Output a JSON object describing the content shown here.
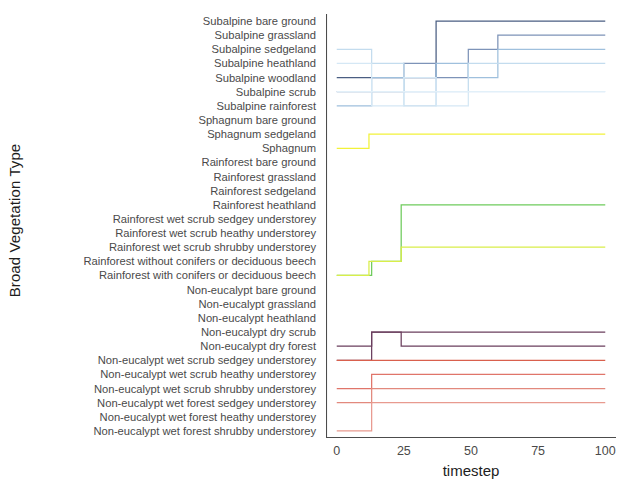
{
  "chart_data": {
    "type": "line",
    "title": "",
    "xlabel": "timestep",
    "ylabel": "Broad Vegetation Type",
    "xlim": [
      -4,
      104
    ],
    "ylim": [
      0,
      30
    ],
    "grid": false,
    "legend": "none",
    "xticks": [
      0,
      25,
      50,
      75,
      100
    ],
    "xticklabels": [
      "0",
      "25",
      "50",
      "75",
      "100"
    ],
    "categories": [
      "Subalpine bare ground",
      "Subalpine grassland",
      "Subalpine sedgeland",
      "Subalpine heathland",
      "Subalpine woodland",
      "Subalpine scrub",
      "Subalpine rainforest",
      "Sphagnum bare ground",
      "Sphagnum sedgeland",
      "Sphagnum",
      "Rainforest bare ground",
      "Rainforest grassland",
      "Rainforest sedgeland",
      "Rainforest heathland",
      "Rainforest wet scrub sedgey understorey",
      "Rainforest wet scrub heathy understorey",
      "Rainforest wet scrub shrubby understorey",
      "Rainforest without conifers or deciduous beech",
      "Rainforest with conifers or deciduous beech",
      "Non-eucalypt bare ground",
      "Non-eucalypt grassland",
      "Non-eucalypt heathland",
      "Non-eucalypt dry scrub",
      "Non-eucalypt dry forest",
      "Non-eucalypt wet scrub sedgey understorey",
      "Non-eucalypt wet scrub heathy understorey",
      "Non-eucalypt wet scrub shrubby understorey",
      "Non-eucalypt wet forest sedgey understorey",
      "Non-eucalypt wet forest heathy understorey",
      "Non-eucalypt wet forest shrubby understorey"
    ],
    "series": [
      {
        "name": "Subalpine bare ground",
        "color": "#4a5e82",
        "points": [
          [
            0,
            4
          ],
          [
            37,
            4
          ],
          [
            37,
            0
          ],
          [
            100,
            0
          ]
        ]
      },
      {
        "name": "Subalpine grassland",
        "color": "#7d93b8",
        "points": [
          [
            0,
            5
          ],
          [
            25,
            5
          ],
          [
            25,
            3
          ],
          [
            37,
            3
          ],
          [
            37,
            4
          ],
          [
            49,
            4
          ],
          [
            49,
            2
          ],
          [
            60,
            2
          ],
          [
            60,
            1
          ],
          [
            100,
            1
          ]
        ]
      },
      {
        "name": "Subalpine sedgeland",
        "color": "#9fc0dd",
        "points": [
          [
            0,
            6
          ],
          [
            13,
            6
          ],
          [
            13,
            4
          ],
          [
            25,
            4
          ],
          [
            25,
            5
          ],
          [
            37,
            5
          ],
          [
            37,
            3
          ],
          [
            49,
            3
          ],
          [
            49,
            4
          ],
          [
            60,
            4
          ],
          [
            60,
            2
          ],
          [
            100,
            2
          ]
        ]
      },
      {
        "name": "Subalpine heathland",
        "color": "#c3dcee",
        "points": [
          [
            0,
            2
          ],
          [
            13,
            2
          ],
          [
            13,
            3
          ],
          [
            25,
            3
          ],
          [
            25,
            6
          ],
          [
            37,
            6
          ],
          [
            37,
            5
          ],
          [
            49,
            5
          ],
          [
            49,
            3
          ],
          [
            100,
            3
          ]
        ]
      },
      {
        "name": "Subalpine woodland",
        "color": "#d5e8f5",
        "points": [
          [
            0,
            3
          ],
          [
            13,
            3
          ],
          [
            13,
            6
          ],
          [
            25,
            6
          ],
          [
            25,
            4
          ],
          [
            37,
            4
          ],
          [
            37,
            6
          ],
          [
            49,
            6
          ],
          [
            49,
            5
          ],
          [
            100,
            5
          ]
        ]
      },
      {
        "name": "Subalpine scrub",
        "color": "#e2f0f9",
        "points": [
          [
            0,
            5
          ],
          [
            13,
            5
          ],
          [
            13,
            5
          ],
          [
            25,
            5
          ],
          [
            25,
            5
          ],
          [
            100,
            5
          ]
        ]
      },
      {
        "name": "Sphagnum",
        "color": "#f2f23a",
        "points": [
          [
            0,
            9
          ],
          [
            12,
            9
          ],
          [
            12,
            8
          ],
          [
            100,
            8
          ]
        ]
      },
      {
        "name": "Rainforest wet scrub sedgey understorey",
        "color": "#6fcb5c",
        "points": [
          [
            0,
            18
          ],
          [
            13,
            18
          ],
          [
            13,
            17
          ],
          [
            24,
            17
          ],
          [
            24,
            13
          ],
          [
            100,
            13
          ]
        ]
      },
      {
        "name": "Rainforest with conifers or deciduous beech",
        "color": "#d9ee4a",
        "points": [
          [
            0,
            18
          ],
          [
            12,
            18
          ],
          [
            12,
            17
          ],
          [
            24,
            17
          ],
          [
            24,
            16
          ],
          [
            100,
            16
          ]
        ]
      },
      {
        "name": "Non-eucalypt dry scrub",
        "color": "#6b3f5e",
        "points": [
          [
            0,
            23
          ],
          [
            13,
            23
          ],
          [
            13,
            22
          ],
          [
            24,
            22
          ],
          [
            24,
            22
          ],
          [
            100,
            22
          ]
        ]
      },
      {
        "name": "Non-eucalypt dry forest",
        "color": "#6b3f5e",
        "points": [
          [
            0,
            24
          ],
          [
            13,
            24
          ],
          [
            13,
            22
          ],
          [
            24,
            22
          ],
          [
            24,
            23
          ],
          [
            100,
            23
          ]
        ]
      },
      {
        "name": "Non-eucalypt wet scrub sedgey understorey",
        "color": "#d9604d",
        "points": [
          [
            0,
            24
          ],
          [
            13,
            24
          ],
          [
            13,
            24
          ],
          [
            100,
            24
          ]
        ]
      },
      {
        "name": "Non-eucalypt wet scrub heathy understorey",
        "color": "#e0756a",
        "points": [
          [
            0,
            26
          ],
          [
            13,
            26
          ],
          [
            13,
            25
          ],
          [
            100,
            25
          ]
        ]
      },
      {
        "name": "Non-eucalypt wet scrub shrubby understorey",
        "color": "#e2897d",
        "points": [
          [
            0,
            27
          ],
          [
            13,
            27
          ],
          [
            13,
            26
          ],
          [
            100,
            26
          ]
        ]
      },
      {
        "name": "Non-eucalypt wet forest sedgey understorey",
        "color": "#e89a8f",
        "points": [
          [
            0,
            29
          ],
          [
            13,
            29
          ],
          [
            13,
            27
          ],
          [
            100,
            27
          ]
        ]
      }
    ]
  },
  "axes": {
    "ylabel_text": "Broad Vegetation Type",
    "xlabel_text": "timestep"
  }
}
